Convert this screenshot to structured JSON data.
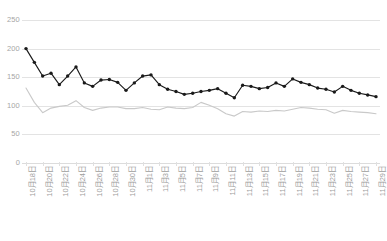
{
  "chart_data": {
    "type": "line",
    "title": "",
    "xlabel": "",
    "ylabel": "",
    "ylim": [
      0,
      250
    ],
    "ytick_step": 50,
    "yticks": [
      250,
      200,
      150,
      100,
      50,
      0
    ],
    "grid": true,
    "legend": "none",
    "x_label_interval": 2,
    "x_label_rotation": -90,
    "x": [
      "10月18日",
      "10月19日",
      "10月20日",
      "10月21日",
      "10月22日",
      "10月23日",
      "10月24日",
      "10月25日",
      "10月26日",
      "10月27日",
      "10月28日",
      "10月29日",
      "10月30日",
      "10月31日",
      "11月1日",
      "11月2日",
      "11月3日",
      "11月4日",
      "11月5日",
      "11月6日",
      "11月7日",
      "11月8日",
      "11月9日",
      "11月10日",
      "11月11日",
      "11月12日",
      "11月13日",
      "11月14日",
      "11月15日",
      "11月16日",
      "11月17日",
      "11月18日",
      "11月19日",
      "11月20日",
      "11月21日",
      "11月22日",
      "11月23日",
      "11月24日",
      "11月25日",
      "11月26日",
      "11月27日",
      "11月28日",
      "11月29日"
    ],
    "xticklabels": [
      "10月18日",
      "10月20日",
      "10月22日",
      "10月24日",
      "10月26日",
      "10月28日",
      "10月30日",
      "11月1日",
      "11月3日",
      "11月5日",
      "11月7日",
      "11月9日",
      "11月11日",
      "11月13日",
      "11月15日",
      "11月17日",
      "11月19日",
      "11月21日",
      "11月23日",
      "11月25日",
      "11月27日",
      "11月29日"
    ],
    "series": [
      {
        "name": "series-black",
        "color": "#1a1a1a",
        "marker": "circle",
        "values": [
          200,
          176,
          152,
          157,
          137,
          152,
          168,
          140,
          134,
          145,
          146,
          141,
          127,
          140,
          152,
          154,
          137,
          129,
          125,
          120,
          122,
          125,
          127,
          130,
          122,
          114,
          136,
          134,
          130,
          132,
          140,
          134,
          147,
          141,
          137,
          131,
          129,
          124,
          134,
          127,
          122,
          119,
          116
        ]
      },
      {
        "name": "series-gray",
        "color": "#c9c9c9",
        "marker": "none",
        "values": [
          131,
          106,
          88,
          96,
          99,
          101,
          109,
          97,
          92,
          96,
          98,
          98,
          95,
          95,
          97,
          94,
          93,
          98,
          96,
          95,
          97,
          106,
          101,
          95,
          86,
          82,
          90,
          89,
          91,
          90,
          92,
          91,
          94,
          97,
          96,
          94,
          93,
          87,
          92,
          90,
          89,
          88,
          86
        ]
      }
    ]
  }
}
